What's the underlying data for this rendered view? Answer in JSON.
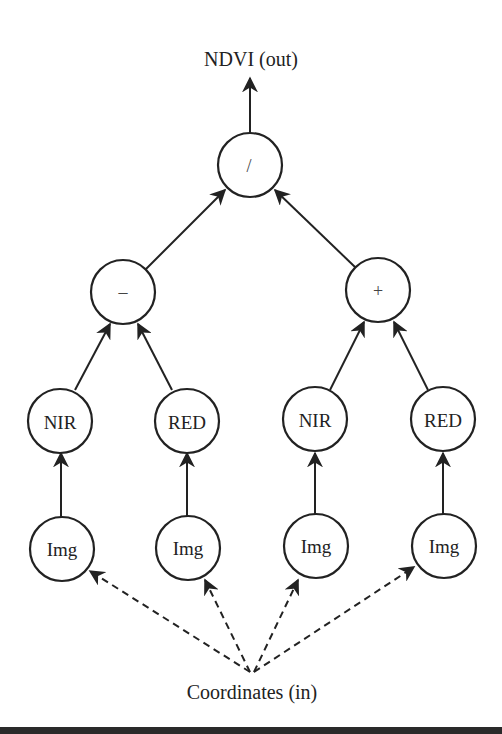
{
  "diagram": {
    "output_label": "NDVI (out)",
    "input_label": "Coordinates (in)",
    "root": {
      "id": "div",
      "label": "/"
    },
    "operators": [
      {
        "id": "minus",
        "label": "–"
      },
      {
        "id": "plus",
        "label": "+"
      }
    ],
    "bands": [
      {
        "id": "nir1",
        "label": "NIR"
      },
      {
        "id": "red1",
        "label": "RED"
      },
      {
        "id": "nir2",
        "label": "NIR"
      },
      {
        "id": "red2",
        "label": "RED"
      }
    ],
    "images": [
      {
        "id": "img1",
        "label": "Img"
      },
      {
        "id": "img2",
        "label": "Img"
      },
      {
        "id": "img3",
        "label": "Img"
      },
      {
        "id": "img4",
        "label": "Img"
      }
    ],
    "edges": [
      {
        "from": "div",
        "to": "NDVI (out)",
        "style": "solid"
      },
      {
        "from": "minus",
        "to": "div",
        "style": "solid"
      },
      {
        "from": "plus",
        "to": "div",
        "style": "solid"
      },
      {
        "from": "nir1",
        "to": "minus",
        "style": "solid"
      },
      {
        "from": "red1",
        "to": "minus",
        "style": "solid"
      },
      {
        "from": "nir2",
        "to": "plus",
        "style": "solid"
      },
      {
        "from": "red2",
        "to": "plus",
        "style": "solid"
      },
      {
        "from": "img1",
        "to": "nir1",
        "style": "solid"
      },
      {
        "from": "img2",
        "to": "red1",
        "style": "solid"
      },
      {
        "from": "img3",
        "to": "nir2",
        "style": "solid"
      },
      {
        "from": "img4",
        "to": "red2",
        "style": "solid"
      },
      {
        "from": "Coordinates (in)",
        "to": "img1",
        "style": "dashed"
      },
      {
        "from": "Coordinates (in)",
        "to": "img2",
        "style": "dashed"
      },
      {
        "from": "Coordinates (in)",
        "to": "img3",
        "style": "dashed"
      },
      {
        "from": "Coordinates (in)",
        "to": "img4",
        "style": "dashed"
      }
    ]
  }
}
